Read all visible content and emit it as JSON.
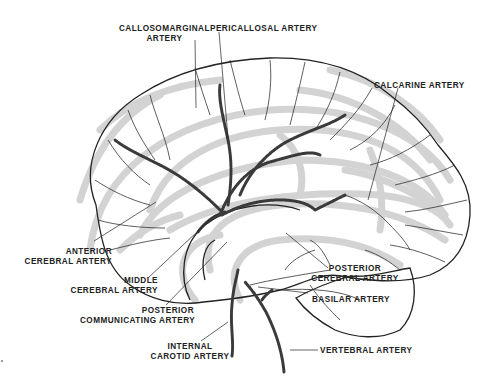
{
  "diagram": {
    "colors": {
      "outline": "#222222",
      "artery": "#444444",
      "gyri_shading": "#c8c8c8",
      "label_text": "#222222",
      "background": "#ffffff"
    },
    "labels": {
      "callosomarginal": {
        "line1": "CALLOSOMARGINAL",
        "line2": "ARTERY"
      },
      "pericallosal": {
        "line1": "PERICALLOSAL ARTERY"
      },
      "calcarine": {
        "line1": "CALCARINE ARTERY"
      },
      "anterior_cerebral": {
        "line1": "ANTERIOR",
        "line2": "CEREBRAL ARTERY"
      },
      "middle_cerebral": {
        "line1": "MIDDLE",
        "line2": "CEREBRAL ARTERY"
      },
      "posterior_communicating": {
        "line1": "POSTERIOR",
        "line2": "COMMUNICATING ARTERY"
      },
      "internal_carotid": {
        "line1": "INTERNAL",
        "line2": "CAROTID ARTERY"
      },
      "posterior_cerebral": {
        "line1": "POSTERIOR",
        "line2": "CEREBRAL ARTERY"
      },
      "basilar": {
        "line1": "BASILAR ARTERY"
      },
      "vertebral": {
        "line1": "VERTEBRAL ARTERY"
      }
    }
  }
}
